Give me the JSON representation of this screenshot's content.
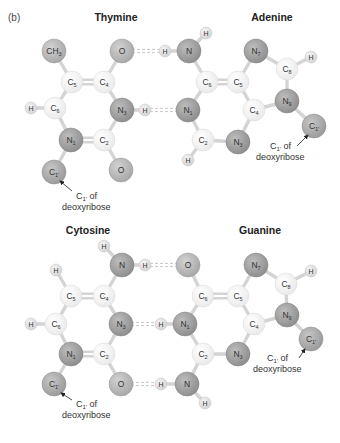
{
  "panel_label": "(b)",
  "colors": {
    "carbon": "#f2f2f2",
    "carbon_edge": "#d8d8d8",
    "nitrogen": "#9e9e9e",
    "nitrogen_edge": "#7f7f7f",
    "oxygen": "#b5b5b5",
    "oxygen_edge": "#969696",
    "hydrogen": "#e2e2e2",
    "hydrogen_edge": "#c4c4c4",
    "sugar_carbon": "#a8a8a8",
    "bond": "#d4d4d4",
    "hbond": "#c8c8c8"
  },
  "pairs": [
    {
      "name": "thymine-adenine",
      "left_title": "Thymine",
      "right_title": "Adenine",
      "left_title_pos": [
        116,
        21
      ],
      "right_title_pos": [
        272,
        21
      ],
      "atoms": [
        {
          "id": "t_ch3",
          "label": "CH3",
          "display": "CH",
          "sub": "3",
          "type": "oxygen",
          "x": 54,
          "y": 51,
          "r": 12
        },
        {
          "id": "t_o4",
          "label": "O",
          "display": "O",
          "sub": "",
          "type": "oxygen",
          "x": 122,
          "y": 51,
          "r": 12
        },
        {
          "id": "t_c5",
          "label": "C5",
          "display": "C",
          "sub": "5",
          "type": "carbon",
          "x": 72,
          "y": 82,
          "r": 11
        },
        {
          "id": "t_c4",
          "label": "C4",
          "display": "C",
          "sub": "4",
          "type": "carbon",
          "x": 104,
          "y": 82,
          "r": 11
        },
        {
          "id": "t_h6",
          "label": "H",
          "display": "H",
          "sub": "",
          "type": "hydrogen",
          "x": 31,
          "y": 108,
          "r": 6
        },
        {
          "id": "t_c6",
          "label": "C6",
          "display": "C",
          "sub": "6",
          "type": "carbon",
          "x": 55,
          "y": 108,
          "r": 11
        },
        {
          "id": "t_n3",
          "label": "N3",
          "display": "N",
          "sub": "3",
          "type": "nitrogen",
          "x": 122,
          "y": 110,
          "r": 12
        },
        {
          "id": "t_n1",
          "label": "N1",
          "display": "N",
          "sub": "1",
          "type": "nitrogen",
          "x": 71,
          "y": 140,
          "r": 12
        },
        {
          "id": "t_c2",
          "label": "C2",
          "display": "C",
          "sub": "2",
          "type": "carbon",
          "x": 104,
          "y": 140,
          "r": 11
        },
        {
          "id": "t_c1",
          "label": "C1'",
          "display": "C",
          "sub": "1'",
          "type": "sugar",
          "x": 54,
          "y": 172,
          "r": 12
        },
        {
          "id": "t_o2",
          "label": "O",
          "display": "O",
          "sub": "",
          "type": "oxygen",
          "x": 121,
          "y": 170,
          "r": 12
        },
        {
          "id": "a_h_n3h",
          "label": "H",
          "display": "H",
          "sub": "",
          "type": "hydrogen",
          "x": 145,
          "y": 110,
          "r": 6
        },
        {
          "id": "a_h6a",
          "label": "H",
          "display": "H",
          "sub": "",
          "type": "hydrogen",
          "x": 165,
          "y": 51,
          "r": 6
        },
        {
          "id": "a_n6",
          "label": "N",
          "display": "N",
          "sub": "",
          "type": "nitrogen",
          "x": 189,
          "y": 51,
          "r": 12
        },
        {
          "id": "a_h6b",
          "label": "H",
          "display": "H",
          "sub": "",
          "type": "hydrogen",
          "x": 206,
          "y": 33,
          "r": 6
        },
        {
          "id": "a_c6",
          "label": "C6",
          "display": "C",
          "sub": "6",
          "type": "carbon",
          "x": 207,
          "y": 82,
          "r": 11
        },
        {
          "id": "a_c5",
          "label": "C5",
          "display": "C",
          "sub": "5",
          "type": "carbon",
          "x": 238,
          "y": 82,
          "r": 11
        },
        {
          "id": "a_n7",
          "label": "N7",
          "display": "N",
          "sub": "7",
          "type": "nitrogen",
          "x": 256,
          "y": 51,
          "r": 12
        },
        {
          "id": "a_c8",
          "label": "C8",
          "display": "C",
          "sub": "8",
          "type": "carbon",
          "x": 287,
          "y": 69,
          "r": 11
        },
        {
          "id": "a_h8",
          "label": "H",
          "display": "H",
          "sub": "",
          "type": "hydrogen",
          "x": 311,
          "y": 57,
          "r": 6
        },
        {
          "id": "a_n1",
          "label": "N1",
          "display": "N",
          "sub": "1",
          "type": "nitrogen",
          "x": 188,
          "y": 110,
          "r": 12
        },
        {
          "id": "a_c4",
          "label": "C4",
          "display": "C",
          "sub": "4",
          "type": "carbon",
          "x": 254,
          "y": 110,
          "r": 11
        },
        {
          "id": "a_n9",
          "label": "N9",
          "display": "N",
          "sub": "9",
          "type": "nitrogen",
          "x": 287,
          "y": 101,
          "r": 12
        },
        {
          "id": "a_c2",
          "label": "C2",
          "display": "C",
          "sub": "2",
          "type": "carbon",
          "x": 203,
          "y": 140,
          "r": 11
        },
        {
          "id": "a_n3",
          "label": "N3",
          "display": "N",
          "sub": "3",
          "type": "nitrogen",
          "x": 238,
          "y": 142,
          "r": 12
        },
        {
          "id": "a_h2",
          "label": "H",
          "display": "H",
          "sub": "",
          "type": "hydrogen",
          "x": 188,
          "y": 160,
          "r": 6
        },
        {
          "id": "a_c1",
          "label": "C1'",
          "display": "C",
          "sub": "1'",
          "type": "sugar",
          "x": 314,
          "y": 126,
          "r": 12
        }
      ],
      "bonds": [
        [
          "t_ch3",
          "t_c5",
          1
        ],
        [
          "t_c5",
          "t_c4",
          2
        ],
        [
          "t_c4",
          "t_o4",
          1
        ],
        [
          "t_c5",
          "t_c6",
          1
        ],
        [
          "t_h6",
          "t_c6",
          1
        ],
        [
          "t_c4",
          "t_n3",
          1
        ],
        [
          "t_c6",
          "t_n1",
          1
        ],
        [
          "t_n1",
          "t_c2",
          2
        ],
        [
          "t_c2",
          "t_n3",
          1
        ],
        [
          "t_n1",
          "t_c1",
          1
        ],
        [
          "t_c2",
          "t_o2",
          1
        ],
        [
          "t_n3",
          "a_h_n3h",
          1
        ],
        [
          "a_h6a",
          "a_n6",
          1
        ],
        [
          "a_n6",
          "a_h6b",
          1
        ],
        [
          "a_n6",
          "a_c6",
          1
        ],
        [
          "a_c6",
          "a_c5",
          2
        ],
        [
          "a_c5",
          "a_n7",
          1
        ],
        [
          "a_n7",
          "a_c8",
          1
        ],
        [
          "a_c8",
          "a_h8",
          1
        ],
        [
          "a_c8",
          "a_n9",
          1
        ],
        [
          "a_c6",
          "a_n1",
          1
        ],
        [
          "a_c5",
          "a_c4",
          1
        ],
        [
          "a_c4",
          "a_n9",
          1
        ],
        [
          "a_n1",
          "a_c2",
          1
        ],
        [
          "a_c2",
          "a_n3",
          1
        ],
        [
          "a_n3",
          "a_c4",
          1
        ],
        [
          "a_c2",
          "a_h2",
          1
        ],
        [
          "a_n9",
          "a_c1",
          1
        ]
      ],
      "hbonds": [
        [
          "t_o4",
          "a_h6a"
        ],
        [
          "a_h_n3h",
          "a_n1"
        ]
      ],
      "annotations": [
        {
          "line1": "C1' of",
          "line1_main": "C",
          "line1_sub": "1'",
          "line1_rest": " of",
          "line2": "deoxyribose",
          "x": 62,
          "y": 199,
          "arrow_from": [
            72,
            191
          ],
          "arrow_to": [
            60,
            181
          ]
        },
        {
          "line1": "C1' of",
          "line1_main": "C",
          "line1_sub": "1'",
          "line1_rest": " of",
          "line2": "deoxyribose",
          "x": 256,
          "y": 149,
          "arrow_from": [
            297,
            146
          ],
          "arrow_to": [
            308,
            135
          ]
        }
      ]
    },
    {
      "name": "cytosine-guanine",
      "left_title": "Cytosine",
      "right_title": "Guanine",
      "left_title_pos": [
        88,
        234
      ],
      "right_title_pos": [
        260,
        234
      ],
      "atoms": [
        {
          "id": "c_h4a",
          "label": "H",
          "display": "H",
          "sub": "",
          "type": "hydrogen",
          "x": 104,
          "y": 246,
          "r": 6
        },
        {
          "id": "c_n4",
          "label": "N",
          "display": "N",
          "sub": "",
          "type": "nitrogen",
          "x": 122,
          "y": 265,
          "r": 12
        },
        {
          "id": "c_h4b",
          "label": "H",
          "display": "H",
          "sub": "",
          "type": "hydrogen",
          "x": 145,
          "y": 265,
          "r": 6
        },
        {
          "id": "c_h5",
          "label": "H",
          "display": "H",
          "sub": "",
          "type": "hydrogen",
          "x": 56,
          "y": 270,
          "r": 6
        },
        {
          "id": "c_c5",
          "label": "C5",
          "display": "C",
          "sub": "5",
          "type": "carbon",
          "x": 71,
          "y": 296,
          "r": 11
        },
        {
          "id": "c_c4",
          "label": "C4",
          "display": "C",
          "sub": "4",
          "type": "carbon",
          "x": 104,
          "y": 296,
          "r": 11
        },
        {
          "id": "c_h6",
          "label": "H",
          "display": "H",
          "sub": "",
          "type": "hydrogen",
          "x": 31,
          "y": 324,
          "r": 6
        },
        {
          "id": "c_c6",
          "label": "C6",
          "display": "C",
          "sub": "6",
          "type": "carbon",
          "x": 56,
          "y": 324,
          "r": 11
        },
        {
          "id": "c_n3",
          "label": "N3",
          "display": "N",
          "sub": "3",
          "type": "nitrogen",
          "x": 121,
          "y": 324,
          "r": 12
        },
        {
          "id": "c_n1",
          "label": "N1",
          "display": "N",
          "sub": "1",
          "type": "nitrogen",
          "x": 71,
          "y": 354,
          "r": 12
        },
        {
          "id": "c_c2",
          "label": "C2",
          "display": "C",
          "sub": "2",
          "type": "carbon",
          "x": 104,
          "y": 354,
          "r": 11
        },
        {
          "id": "c_c1",
          "label": "C1'",
          "display": "C",
          "sub": "1'",
          "type": "sugar",
          "x": 54,
          "y": 384,
          "r": 12
        },
        {
          "id": "c_o2",
          "label": "O",
          "display": "O",
          "sub": "",
          "type": "oxygen",
          "x": 121,
          "y": 384,
          "r": 12
        },
        {
          "id": "g_o6",
          "label": "O",
          "display": "O",
          "sub": "",
          "type": "oxygen",
          "x": 188,
          "y": 265,
          "r": 12
        },
        {
          "id": "g_c6",
          "label": "C6",
          "display": "C",
          "sub": "6",
          "type": "carbon",
          "x": 203,
          "y": 296,
          "r": 11
        },
        {
          "id": "g_c5",
          "label": "C5",
          "display": "C",
          "sub": "5",
          "type": "carbon",
          "x": 238,
          "y": 296,
          "r": 11
        },
        {
          "id": "g_n7",
          "label": "N7",
          "display": "N",
          "sub": "7",
          "type": "nitrogen",
          "x": 256,
          "y": 265,
          "r": 12
        },
        {
          "id": "g_c8",
          "label": "C8",
          "display": "C",
          "sub": "8",
          "type": "carbon",
          "x": 286,
          "y": 284,
          "r": 11
        },
        {
          "id": "g_h8",
          "label": "H",
          "display": "H",
          "sub": "",
          "type": "hydrogen",
          "x": 311,
          "y": 271,
          "r": 6
        },
        {
          "id": "g_h1",
          "label": "H",
          "display": "H",
          "sub": "",
          "type": "hydrogen",
          "x": 161,
          "y": 324,
          "r": 6
        },
        {
          "id": "g_n1",
          "label": "N1",
          "display": "N",
          "sub": "1",
          "type": "nitrogen",
          "x": 185,
          "y": 324,
          "r": 12
        },
        {
          "id": "g_c4",
          "label": "C4",
          "display": "C",
          "sub": "4",
          "type": "carbon",
          "x": 254,
          "y": 324,
          "r": 11
        },
        {
          "id": "g_n9",
          "label": "N9",
          "display": "N",
          "sub": "9",
          "type": "nitrogen",
          "x": 287,
          "y": 315,
          "r": 12
        },
        {
          "id": "g_c2",
          "label": "C2",
          "display": "C",
          "sub": "2",
          "type": "carbon",
          "x": 203,
          "y": 354,
          "r": 11
        },
        {
          "id": "g_n3",
          "label": "N3",
          "display": "N",
          "sub": "3",
          "type": "nitrogen",
          "x": 238,
          "y": 354,
          "r": 12
        },
        {
          "id": "g_c1",
          "label": "C1'",
          "display": "C",
          "sub": "1'",
          "type": "sugar",
          "x": 311,
          "y": 339,
          "r": 12
        },
        {
          "id": "g_h2a",
          "label": "H",
          "display": "H",
          "sub": "",
          "type": "hydrogen",
          "x": 161,
          "y": 384,
          "r": 6
        },
        {
          "id": "g_n2",
          "label": "N",
          "display": "N",
          "sub": "",
          "type": "nitrogen",
          "x": 187,
          "y": 384,
          "r": 12
        },
        {
          "id": "g_h2b",
          "label": "H",
          "display": "H",
          "sub": "",
          "type": "hydrogen",
          "x": 205,
          "y": 403,
          "r": 6
        }
      ],
      "bonds": [
        [
          "c_h4a",
          "c_n4",
          1
        ],
        [
          "c_n4",
          "c_h4b",
          1
        ],
        [
          "c_n4",
          "c_c4",
          1
        ],
        [
          "c_h5",
          "c_c5",
          1
        ],
        [
          "c_c5",
          "c_c4",
          2
        ],
        [
          "c_c5",
          "c_c6",
          1
        ],
        [
          "c_h6",
          "c_c6",
          1
        ],
        [
          "c_c4",
          "c_n3",
          1
        ],
        [
          "c_c6",
          "c_n1",
          1
        ],
        [
          "c_n1",
          "c_c2",
          2
        ],
        [
          "c_c2",
          "c_n3",
          1
        ],
        [
          "c_n1",
          "c_c1",
          1
        ],
        [
          "c_c2",
          "c_o2",
          1
        ],
        [
          "g_o6",
          "g_c6",
          1
        ],
        [
          "g_c6",
          "g_c5",
          2
        ],
        [
          "g_c5",
          "g_n7",
          1
        ],
        [
          "g_n7",
          "g_c8",
          1
        ],
        [
          "g_c8",
          "g_h8",
          1
        ],
        [
          "g_c8",
          "g_n9",
          1
        ],
        [
          "g_c6",
          "g_n1",
          1
        ],
        [
          "g_h1",
          "g_n1",
          1
        ],
        [
          "g_c5",
          "g_c4",
          1
        ],
        [
          "g_c4",
          "g_n9",
          1
        ],
        [
          "g_n1",
          "g_c2",
          1
        ],
        [
          "g_c2",
          "g_n3",
          1
        ],
        [
          "g_n3",
          "g_c4",
          1
        ],
        [
          "g_n9",
          "g_c1",
          1
        ],
        [
          "g_c2",
          "g_n2",
          1
        ],
        [
          "g_h2a",
          "g_n2",
          1
        ],
        [
          "g_n2",
          "g_h2b",
          1
        ]
      ],
      "hbonds": [
        [
          "c_h4b",
          "g_o6"
        ],
        [
          "c_n3",
          "g_h1"
        ],
        [
          "c_o2",
          "g_h2a"
        ]
      ],
      "annotations": [
        {
          "line1": "C1' of",
          "line1_main": "C",
          "line1_sub": "1'",
          "line1_rest": " of",
          "line2": "deoxyribose",
          "x": 62,
          "y": 407,
          "arrow_from": [
            72,
            400
          ],
          "arrow_to": [
            61,
            393
          ]
        },
        {
          "line1": "C1' of",
          "line1_main": "C",
          "line1_sub": "1'",
          "line1_rest": " of",
          "line2": "deoxyribose",
          "x": 253,
          "y": 361,
          "arrow_from": [
            299,
            358
          ],
          "arrow_to": [
            305,
            349
          ]
        }
      ]
    }
  ]
}
